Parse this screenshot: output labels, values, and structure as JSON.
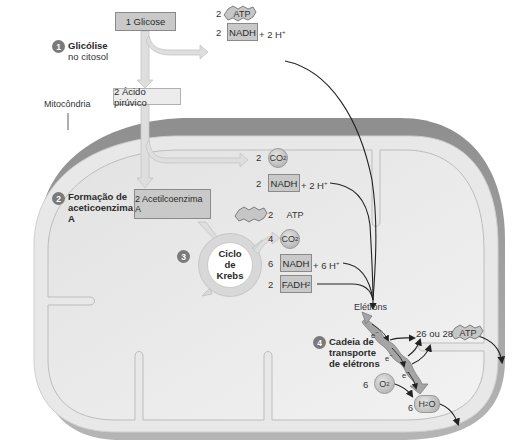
{
  "colors": {
    "outer_membrane": "#9a9a9a",
    "inner_space": "#e6e6e6",
    "matrix": "#eeeeee",
    "box_fill": "#c9c9c9",
    "arrow_fill": "#dcdcdc",
    "line": "#222222"
  },
  "labels": {
    "mitocondria": "Mitocôndria",
    "eletrons": "Elétrons"
  },
  "stages": [
    {
      "number": "1",
      "title": "Glicólise",
      "subtitle": "no citosol"
    },
    {
      "number": "2",
      "title_line1": "Formação de",
      "title_line2": "aceticoenzima",
      "title_line3": "A"
    },
    {
      "number": "3",
      "cycle_line1": "Ciclo",
      "cycle_line2": "de",
      "cycle_line3": "Krebs"
    },
    {
      "number": "4",
      "title_line1": "Cadeia de",
      "title_line2": "transporte",
      "title_line3": "de elétrons"
    }
  ],
  "boxes": {
    "glicose": "1 Glicose",
    "acido_piruvico": "2 Ácido pirúvico",
    "acetilcoenzima": "2 Acetilcoenzima A"
  },
  "glycolysis_products": {
    "atp_count": "2",
    "atp_label": "ATP",
    "nadh_count": "2",
    "nadh_label": "NADH",
    "nadh_suffix": "+ 2 H",
    "h_sup": "+"
  },
  "acetyl_products": {
    "co2_count": "2",
    "co2_label": "CO",
    "co2_sub": "2",
    "nadh_count": "2",
    "nadh_label": "NADH",
    "nadh_suffix": "+ 2 H",
    "h_sup": "+"
  },
  "krebs_products": {
    "atp_count": "2",
    "atp_label": "ATP",
    "co2_count": "4",
    "co2_label": "CO",
    "co2_sub": "2",
    "nadh_count": "6",
    "nadh_label": "NADH",
    "nadh_suffix": "+ 6 H",
    "h_sup": "+",
    "fadh_count": "2",
    "fadh_label": "FADH",
    "fadh_sub": "2"
  },
  "etc": {
    "atp_text": "26 ou 28",
    "atp_label": "ATP",
    "electron": "e",
    "electron_sup": "−",
    "o2_count": "6",
    "o2_label": "O",
    "o2_sub": "2",
    "h2o_count": "6",
    "h2o_label_h": "H",
    "h2o_sub": "2",
    "h2o_label_o": "O"
  }
}
